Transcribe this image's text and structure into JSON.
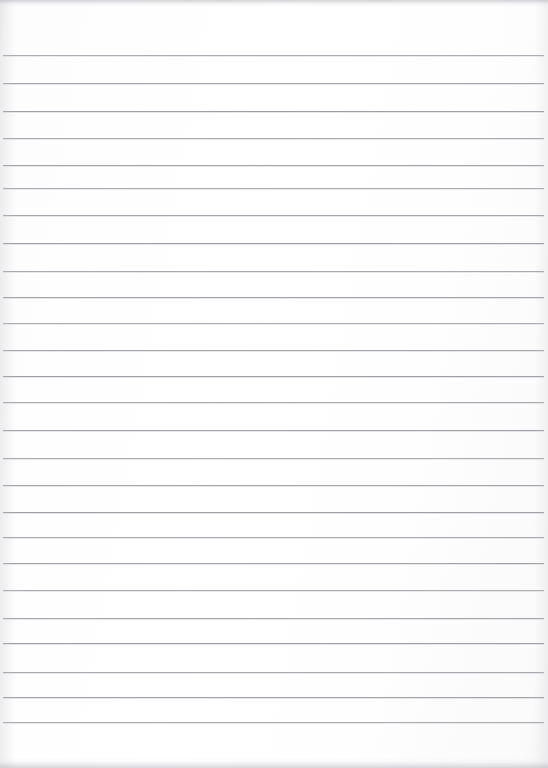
{
  "document": {
    "kind": "scanned-image",
    "subject": "blank ruled notebook paper",
    "page_width": 548,
    "page_height": 768,
    "background_color": "#ffffff",
    "paper_tint": "#fdfdfd",
    "rule_color": "#9b9ba2",
    "edge_artifact_color": "#adadb4",
    "written_content": "",
    "visible_text": ""
  },
  "ruling": {
    "style": "wide-ruled horizontal lines",
    "line_count": 25,
    "first_line_y": 55,
    "last_line_y": 722,
    "average_spacing": 27.8,
    "line_thickness": 1,
    "left_inset": 3,
    "right_inset": 4,
    "has_vertical_margin_rule": false,
    "line_y_positions": [
      55,
      83,
      111,
      138,
      165,
      188,
      215,
      243,
      271,
      297,
      323,
      350,
      376,
      402,
      430,
      458,
      485,
      512,
      537,
      563,
      590,
      618,
      643,
      672,
      697,
      722
    ]
  },
  "artifacts": {
    "top_edge_band": true,
    "bottom_edge_band": true,
    "left_edge_shade": true,
    "right_edge_shade": true
  }
}
